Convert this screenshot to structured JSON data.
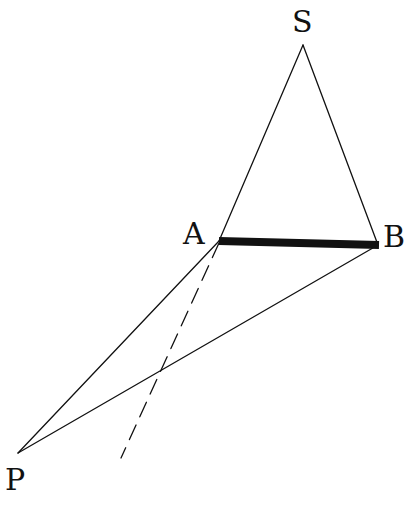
{
  "diagram": {
    "type": "geometry",
    "points": {
      "S": {
        "label": "S",
        "x": 303,
        "y": 45
      },
      "A": {
        "label": "A",
        "x": 219,
        "y": 241
      },
      "B": {
        "label": "B",
        "x": 378,
        "y": 245
      },
      "P": {
        "label": "P",
        "x": 18,
        "y": 453
      }
    },
    "segments": [
      {
        "from": "S",
        "to": "A",
        "style": "thin"
      },
      {
        "from": "S",
        "to": "B",
        "style": "thin"
      },
      {
        "from": "A",
        "to": "B",
        "style": "thick"
      },
      {
        "from": "A",
        "to": "P",
        "style": "thin"
      },
      {
        "from": "B",
        "to": "P",
        "style": "thin"
      },
      {
        "from": "A",
        "to": "dashed-end",
        "style": "dashed"
      }
    ],
    "colors": {
      "line": "#111111",
      "background": "#ffffff"
    }
  }
}
